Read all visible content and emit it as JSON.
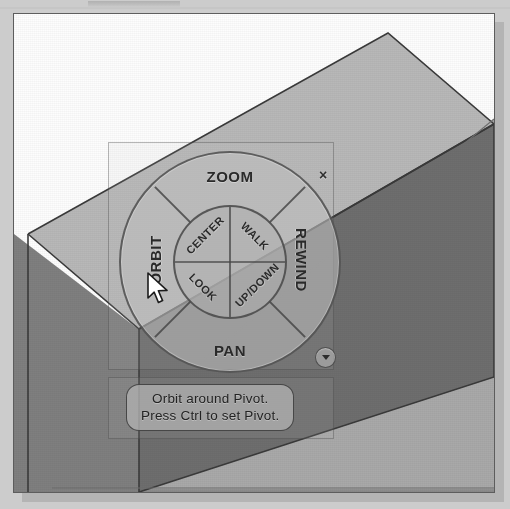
{
  "scene": {
    "description": "3D extruded solid box in CAD viewport",
    "colors": {
      "page_background": "#cccccc",
      "viewport_background": "#fdfdfd",
      "viewport_border": "#5d5d5d",
      "box_top_face": "#b8b8b8",
      "box_right_face": "#6e6e6e",
      "box_left_face": "#7f7f7f",
      "ground_plane": "#a9a9a9",
      "wheel_fill": "#bebebe",
      "wheel_stroke": "#464646",
      "label_text": "#2a2a2a",
      "tooltip_fill": "#b0b0b0"
    }
  },
  "wheel": {
    "name": "Full Navigation SteeringWheel",
    "outer_wedges": [
      {
        "id": "zoom",
        "label": "ZOOM",
        "position": "top"
      },
      {
        "id": "rewind",
        "label": "REWIND",
        "position": "right"
      },
      {
        "id": "pan",
        "label": "PAN",
        "position": "bottom"
      },
      {
        "id": "orbit",
        "label": "ORBIT",
        "position": "left"
      }
    ],
    "inner_wedges": [
      {
        "id": "center",
        "label": "CENTER",
        "position": "top-left"
      },
      {
        "id": "walk",
        "label": "WALK",
        "position": "top-right"
      },
      {
        "id": "updown",
        "label": "UP/DOWN",
        "position": "bottom-right"
      },
      {
        "id": "look",
        "label": "LOOK",
        "position": "bottom-left"
      }
    ],
    "close_label": "×",
    "menu_label": "",
    "active_wedge": "orbit"
  },
  "tooltip": {
    "line1": "Orbit around Pivot.",
    "line2": "Press Ctrl to set Pivot."
  },
  "cursor": {
    "icon": "arrow-pointer",
    "x": 150,
    "y": 276
  }
}
